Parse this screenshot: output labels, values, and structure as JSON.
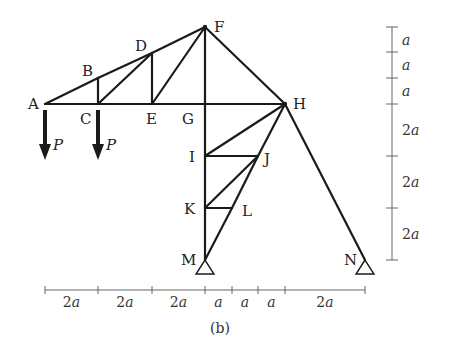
{
  "figure": {
    "caption": "(b)"
  },
  "nodes": [
    {
      "id": "A",
      "label": "A",
      "x": 45,
      "y": 104,
      "lx": 28,
      "ly": 109
    },
    {
      "id": "B",
      "label": "B",
      "x": 98,
      "y": 78,
      "lx": 82,
      "ly": 76
    },
    {
      "id": "C",
      "label": "C",
      "x": 98,
      "y": 104,
      "lx": 80,
      "ly": 124
    },
    {
      "id": "D",
      "label": "D",
      "x": 152,
      "y": 53,
      "lx": 135,
      "ly": 51
    },
    {
      "id": "E",
      "label": "E",
      "x": 152,
      "y": 104,
      "lx": 146,
      "ly": 124
    },
    {
      "id": "F",
      "label": "F",
      "x": 205,
      "y": 27,
      "lx": 214,
      "ly": 32
    },
    {
      "id": "G",
      "label": "G",
      "x": 205,
      "y": 104,
      "lx": 182,
      "ly": 124
    },
    {
      "id": "H",
      "label": "H",
      "x": 285,
      "y": 104,
      "lx": 293,
      "ly": 109
    },
    {
      "id": "I",
      "label": "I",
      "x": 205,
      "y": 156,
      "lx": 189,
      "ly": 162
    },
    {
      "id": "J",
      "label": "J",
      "x": 258,
      "y": 156,
      "lx": 264,
      "ly": 164
    },
    {
      "id": "K",
      "label": "K",
      "x": 205,
      "y": 208,
      "lx": 184,
      "ly": 214
    },
    {
      "id": "L",
      "label": "L",
      "x": 232,
      "y": 208,
      "lx": 242,
      "ly": 216
    },
    {
      "id": "M",
      "label": "M",
      "x": 205,
      "y": 260,
      "lx": 181,
      "ly": 265
    },
    {
      "id": "N",
      "label": "N",
      "x": 365,
      "y": 260,
      "lx": 344,
      "ly": 265
    }
  ],
  "members": [
    [
      "A",
      "B"
    ],
    [
      "B",
      "D"
    ],
    [
      "D",
      "F"
    ],
    [
      "A",
      "C"
    ],
    [
      "C",
      "E"
    ],
    [
      "E",
      "G"
    ],
    [
      "G",
      "H"
    ],
    [
      "B",
      "C"
    ],
    [
      "C",
      "D"
    ],
    [
      "D",
      "E"
    ],
    [
      "E",
      "F"
    ],
    [
      "F",
      "G"
    ],
    [
      "F",
      "H"
    ],
    [
      "G",
      "I"
    ],
    [
      "I",
      "K"
    ],
    [
      "K",
      "M"
    ],
    [
      "H",
      "I"
    ],
    [
      "H",
      "J"
    ],
    [
      "I",
      "J"
    ],
    [
      "J",
      "K"
    ],
    [
      "J",
      "L"
    ],
    [
      "K",
      "L"
    ],
    [
      "L",
      "M"
    ],
    [
      "H",
      "N"
    ]
  ],
  "supports": [
    {
      "node": "M",
      "type": "pin"
    },
    {
      "node": "N",
      "type": "pin"
    }
  ],
  "loads": [
    {
      "node": "A",
      "label": "P",
      "direction": "down"
    },
    {
      "node": "C",
      "label": "P",
      "direction": "down"
    }
  ],
  "dimensions": {
    "horizontal": {
      "y": 290,
      "ticks": [
        45,
        98,
        152,
        205,
        232,
        258,
        285,
        365
      ],
      "labels": [
        "2a",
        "2a",
        "2a",
        "a",
        "a",
        "a",
        "2a"
      ]
    },
    "vertical": {
      "x": 392,
      "ticks": [
        27,
        52,
        78,
        104,
        156,
        208,
        260
      ],
      "labels": [
        "a",
        "a",
        "a",
        "2a",
        "2a",
        "2a"
      ]
    }
  },
  "colors": {
    "member": "#1a1a1a",
    "dimension": "#555555",
    "text": "#222222",
    "background": "#ffffff"
  }
}
